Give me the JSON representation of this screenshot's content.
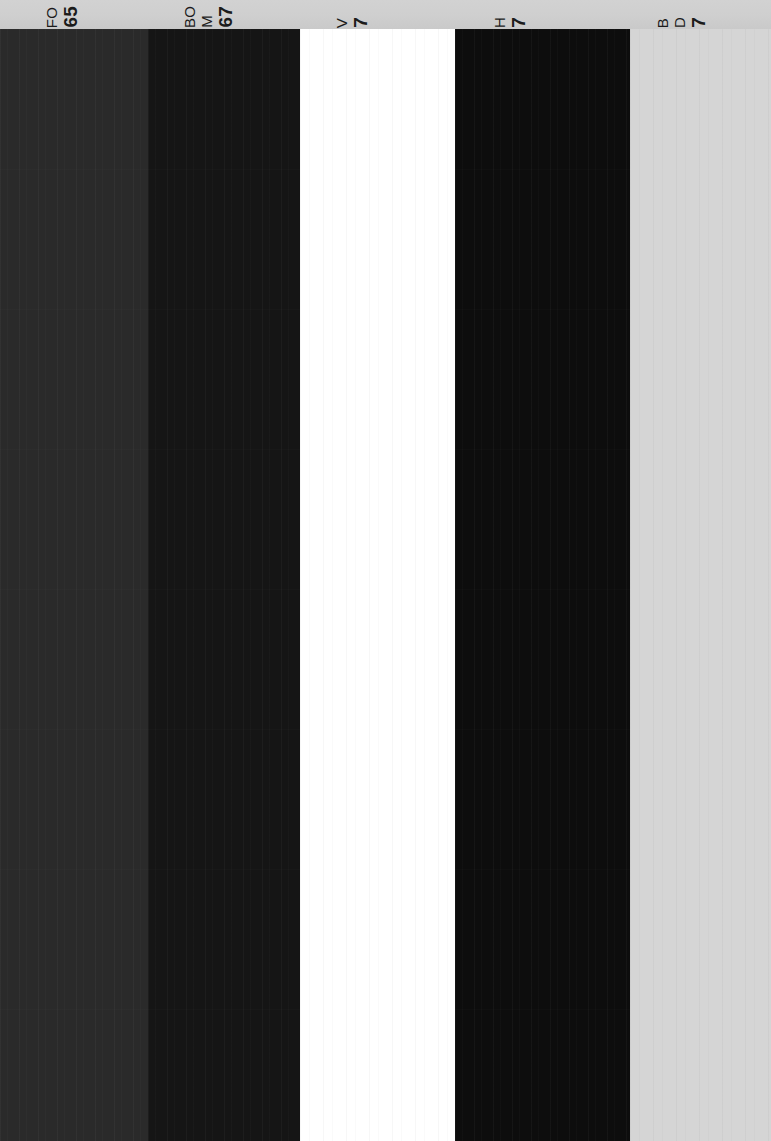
{
  "page": {
    "orientation": "rotated-90",
    "width": 771,
    "height": 1141,
    "header_background": "#cfcfcf"
  },
  "header": {
    "note": "Row of vertically-rotated column labels, clipped by the top edge of the frame; only the lower portion of each glyph is rendered.",
    "clusters": [
      {
        "name": "label-cluster-1",
        "x": 44,
        "lines": [
          {
            "text": "FO",
            "style": "name"
          },
          {
            "text": "65",
            "style": "value"
          }
        ]
      },
      {
        "name": "label-cluster-2",
        "x": 182,
        "lines": [
          {
            "text": "BO",
            "style": "name"
          },
          {
            "text": "M",
            "style": "name"
          },
          {
            "text": "67",
            "style": "value"
          }
        ]
      },
      {
        "name": "label-cluster-3",
        "x": 334,
        "lines": [
          {
            "text": "V",
            "style": "name"
          },
          {
            "text": "7",
            "style": "value"
          }
        ]
      },
      {
        "name": "label-cluster-4",
        "x": 492,
        "lines": [
          {
            "text": "H",
            "style": "name"
          },
          {
            "text": "7",
            "style": "value"
          }
        ]
      },
      {
        "name": "label-cluster-5",
        "x": 655,
        "lines": [
          {
            "text": "B",
            "style": "name"
          },
          {
            "text": "D",
            "style": "name"
          },
          {
            "text": "7",
            "style": "value"
          }
        ]
      }
    ]
  },
  "bands": [
    {
      "name": "band-1",
      "x": 0,
      "width": 148,
      "color": "#2a2a2a",
      "tone": "dark-charcoal",
      "striation": "dark"
    },
    {
      "name": "band-2",
      "x": 148,
      "width": 152,
      "color": "#151515",
      "tone": "near-black",
      "striation": "dark"
    },
    {
      "name": "band-3",
      "x": 300,
      "width": 155,
      "color": "#ffffff",
      "tone": "white",
      "striation": "light"
    },
    {
      "name": "band-4",
      "x": 455,
      "width": 175,
      "color": "#0d0d0d",
      "tone": "black",
      "striation": "dark"
    },
    {
      "name": "band-5",
      "x": 630,
      "width": 141,
      "color": "#d5d5d5",
      "tone": "light-gray",
      "striation": "light"
    }
  ]
}
